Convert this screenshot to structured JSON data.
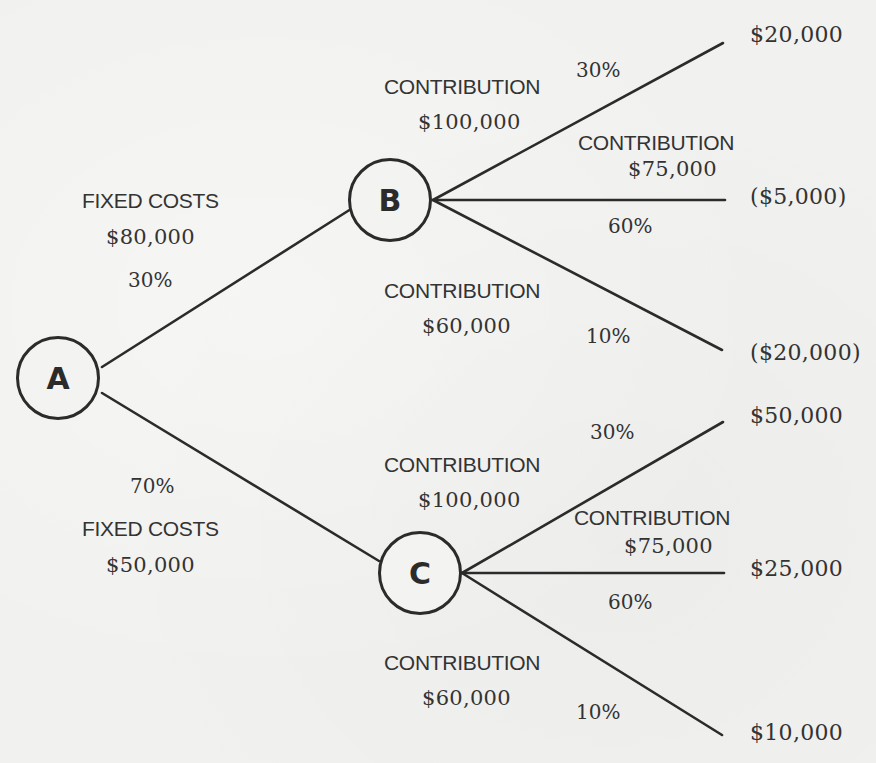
{
  "diagram": {
    "type": "decision-tree",
    "nodes": {
      "a": {
        "label": "A"
      },
      "b": {
        "label": "B"
      },
      "c": {
        "label": "C"
      }
    },
    "branches": {
      "a_to_b": {
        "title": "FIXED COSTS",
        "amount": "$80,000",
        "probability": "30%"
      },
      "a_to_c": {
        "title": "FIXED COSTS",
        "amount": "$50,000",
        "probability": "70%"
      },
      "b_high": {
        "title": "CONTRIBUTION",
        "amount": "$100,000",
        "probability": "30%",
        "outcome": "$20,000"
      },
      "b_mid": {
        "title": "CONTRIBUTION",
        "amount": "$75,000",
        "probability": "60%",
        "outcome": "($5,000)"
      },
      "b_low": {
        "title": "CONTRIBUTION",
        "amount": "$60,000",
        "probability": "10%",
        "outcome": "($20,000)"
      },
      "c_high": {
        "title": "CONTRIBUTION",
        "amount": "$100,000",
        "probability": "30%",
        "outcome": "$50,000"
      },
      "c_mid": {
        "title": "CONTRIBUTION",
        "amount": "$75,000",
        "probability": "60%",
        "outcome": "$25,000"
      },
      "c_low": {
        "title": "CONTRIBUTION",
        "amount": "$60,000",
        "probability": "10%",
        "outcome": "$10,000"
      }
    },
    "colors": {
      "line": "#2b2b2b",
      "text": "#333333",
      "background": "#f1f1ef"
    }
  }
}
